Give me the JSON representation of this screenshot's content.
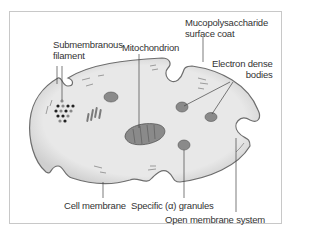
{
  "figure": {
    "type": "platelet-structure-diagram",
    "colors": {
      "cytoplasm": "#e6e6e6",
      "membrane": "#8c8c8c",
      "organelle": "#8a8a8a",
      "leader_line": "#444444",
      "text": "#333333",
      "frame_border": "#c8c8c8"
    }
  },
  "labels": {
    "submembranous_filament": [
      "Submembranous",
      "filament"
    ],
    "mitochondrion": "Mitochondrion",
    "mucopolysaccharide": [
      "Mucopolysaccharide",
      "surface coat"
    ],
    "electron_dense": [
      "Electron dense",
      "bodies"
    ],
    "cell_membrane": "Cell membrane",
    "specific_granules": "Specific (α) granules",
    "open_membrane_system": "Open membrane system"
  }
}
